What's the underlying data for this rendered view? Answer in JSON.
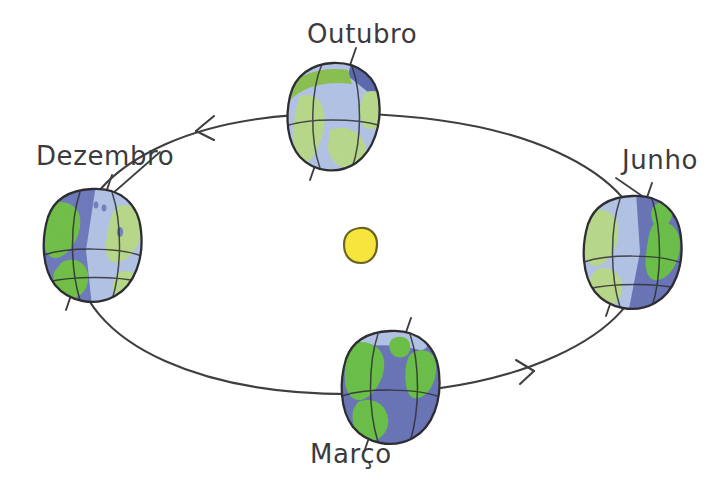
{
  "figure": {
    "background_color": "#ffffff",
    "width": 720,
    "height": 493
  },
  "sun": {
    "name": "Sol",
    "fill_color": "#f5e53c",
    "stroke_color": "#6a6321",
    "cx": 360,
    "cy": 245,
    "rx": 16,
    "ry": 18
  },
  "orbit": {
    "name": "orbita eliptica",
    "stroke_color": "#3f3f42",
    "cx": 360,
    "cy": 254,
    "rx": 285,
    "ry": 140,
    "direction": "anti-horario",
    "arrows": [
      {
        "label": "seta-superior-esquerda",
        "x": 205,
        "y": 128,
        "angle": -160
      },
      {
        "label": "seta-inferior-direita",
        "x": 524,
        "y": 372,
        "angle": -25
      }
    ]
  },
  "earths": [
    {
      "id": "outubro",
      "label": "Outubro",
      "label_x": 307,
      "label_y": 21,
      "cx": 333,
      "cy": 115,
      "rx": 45,
      "ry": 52,
      "axis_tilt_deg": 23,
      "lit_side": "left",
      "ocean_lit": "#b3c4e6",
      "ocean_dark": "#7a88c4",
      "land_lit": "#a8d07a",
      "land_dark": "#5d6bb0",
      "polar_cap": "#5d6bb0"
    },
    {
      "id": "dezembro",
      "label": "Dezembro",
      "label_x": 36,
      "label_y": 143,
      "cx": 92,
      "cy": 243,
      "rx": 48,
      "ry": 54,
      "axis_tilt_deg": 23,
      "lit_side": "right",
      "ocean_lit": "#b3c4e6",
      "ocean_dark": "#6f7cbd",
      "land_lit": "#a8d07a",
      "land_dark": "#73c04a",
      "polar_cap": "#b3c4e6"
    },
    {
      "id": "junho",
      "label": "Junho",
      "label_x": 622,
      "label_y": 147,
      "cx": 632,
      "cy": 250,
      "rx": 48,
      "ry": 54,
      "axis_tilt_deg": 23,
      "lit_side": "left",
      "ocean_lit": "#b3c4e6",
      "ocean_dark": "#6b76b8",
      "land_lit": "#a8d07a",
      "land_dark": "#6cc04a",
      "polar_cap": "#b3c4e6"
    },
    {
      "id": "marco",
      "label": "Março",
      "label_x": 310,
      "label_y": 441,
      "cx": 390,
      "cy": 385,
      "rx": 48,
      "ry": 54,
      "axis_tilt_deg": 23,
      "lit_side": "none",
      "ocean_lit": "#7680c2",
      "ocean_dark": "#6b76b8",
      "land_lit": "#6cc04a",
      "land_dark": "#6cc04a",
      "polar_cap": "#b3c4e6"
    }
  ],
  "strokes": {
    "outline": "#2f2f33",
    "axis": "#3f3f42",
    "leader": "#3f3f42"
  }
}
